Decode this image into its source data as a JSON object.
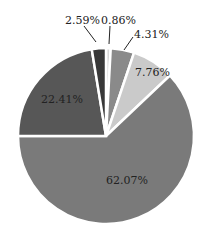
{
  "chart_data": {
    "type": "pie",
    "title": "",
    "start_angle_deg": 0,
    "direction": "clockwise",
    "slices": [
      {
        "label": "0.86%",
        "value": 0.86,
        "color": "#d8d8d8"
      },
      {
        "label": "4.31%",
        "value": 4.31,
        "color": "#8a8a8a"
      },
      {
        "label": "7.76%",
        "value": 7.76,
        "color": "#cacaca"
      },
      {
        "label": "62.07%",
        "value": 62.07,
        "color": "#7a7a7a"
      },
      {
        "label": "22.41%",
        "value": 22.41,
        "color": "#575757"
      },
      {
        "label": "2.59%",
        "value": 2.59,
        "color": "#383838"
      }
    ],
    "legend": null
  },
  "labels": {
    "s0": "0.86%",
    "s1": "4.31%",
    "s2": "7.76%",
    "s3": "62.07%",
    "s4": "22.41%",
    "s5": "2.59%"
  }
}
